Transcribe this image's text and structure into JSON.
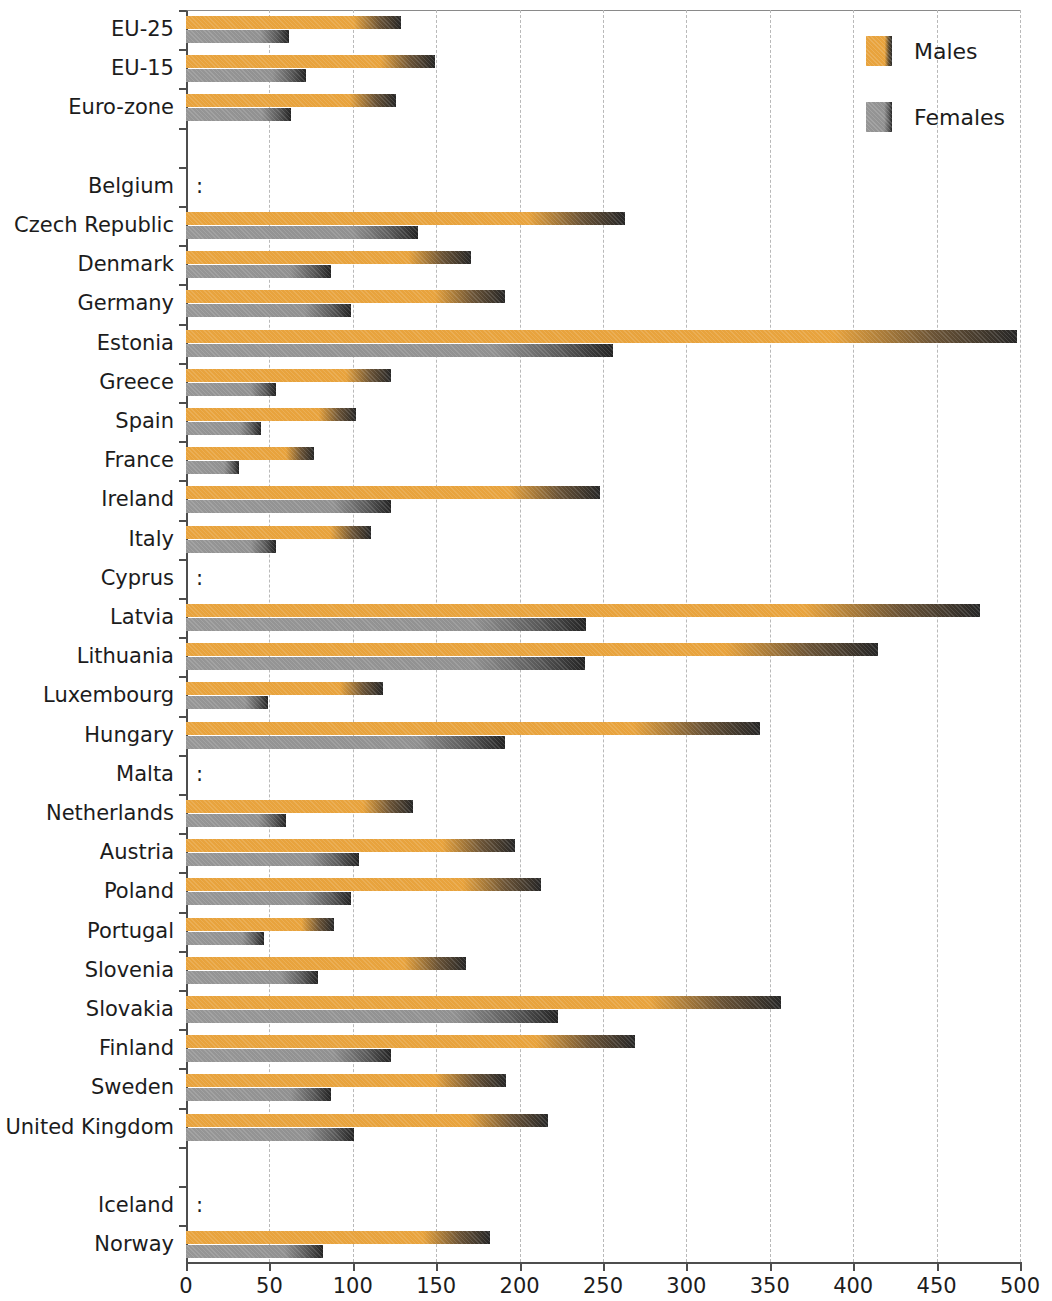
{
  "chart_data": {
    "type": "bar",
    "orientation": "horizontal",
    "title": "",
    "subtitle": "",
    "xlabel": "",
    "ylabel": "",
    "xlim": [
      0,
      500
    ],
    "xticks": [
      0,
      50,
      100,
      150,
      200,
      250,
      300,
      350,
      400,
      450,
      500
    ],
    "grid": true,
    "grid_axis": "x",
    "grid_style": "dotted",
    "legend": {
      "position": "top-right",
      "entries": [
        {
          "name": "Males",
          "color": "#e8a33d"
        },
        {
          "name": "Females",
          "color": "#969696"
        }
      ]
    },
    "missing_marker": ":",
    "categories": [
      "EU-25",
      "EU-15",
      "Euro-zone",
      "",
      "Belgium",
      "Czech Republic",
      "Denmark",
      "Germany",
      "Estonia",
      "Greece",
      "Spain",
      "France",
      "Ireland",
      "Italy",
      "Cyprus",
      "Latvia",
      "Lithuania",
      "Luxembourg",
      "Hungary",
      "Malta",
      "Netherlands",
      "Austria",
      "Poland",
      "Portugal",
      "Slovenia",
      "Slovakia",
      "Finland",
      "Sweden",
      "United Kingdom",
      "",
      "Iceland",
      "Norway"
    ],
    "series": [
      {
        "name": "Males",
        "color": "#e8a33d",
        "values": [
          129,
          149,
          126,
          null,
          null,
          263,
          171,
          191,
          498,
          123,
          102,
          77,
          248,
          111,
          null,
          476,
          415,
          118,
          344,
          null,
          136,
          197,
          213,
          89,
          168,
          357,
          269,
          192,
          217,
          null,
          null,
          182
        ]
      },
      {
        "name": "Females",
        "color": "#969696",
        "values": [
          62,
          72,
          63,
          null,
          null,
          139,
          87,
          99,
          256,
          54,
          45,
          32,
          123,
          54,
          null,
          240,
          239,
          49,
          191,
          null,
          60,
          104,
          99,
          47,
          79,
          223,
          123,
          87,
          101,
          null,
          null,
          82
        ]
      }
    ],
    "rows": [
      {
        "label": "EU-25",
        "male": 129,
        "female": 62,
        "missing": false,
        "gap": false
      },
      {
        "label": "EU-15",
        "male": 149,
        "female": 72,
        "missing": false,
        "gap": false
      },
      {
        "label": "Euro-zone",
        "male": 126,
        "female": 63,
        "missing": false,
        "gap": false
      },
      {
        "label": "",
        "male": null,
        "female": null,
        "missing": false,
        "gap": true
      },
      {
        "label": "Belgium",
        "male": null,
        "female": null,
        "missing": true,
        "gap": false
      },
      {
        "label": "Czech Republic",
        "male": 263,
        "female": 139,
        "missing": false,
        "gap": false
      },
      {
        "label": "Denmark",
        "male": 171,
        "female": 87,
        "missing": false,
        "gap": false
      },
      {
        "label": "Germany",
        "male": 191,
        "female": 99,
        "missing": false,
        "gap": false
      },
      {
        "label": "Estonia",
        "male": 498,
        "female": 256,
        "missing": false,
        "gap": false
      },
      {
        "label": "Greece",
        "male": 123,
        "female": 54,
        "missing": false,
        "gap": false
      },
      {
        "label": "Spain",
        "male": 102,
        "female": 45,
        "missing": false,
        "gap": false
      },
      {
        "label": "France",
        "male": 77,
        "female": 32,
        "missing": false,
        "gap": false
      },
      {
        "label": "Ireland",
        "male": 248,
        "female": 123,
        "missing": false,
        "gap": false
      },
      {
        "label": "Italy",
        "male": 111,
        "female": 54,
        "missing": false,
        "gap": false
      },
      {
        "label": "Cyprus",
        "male": null,
        "female": null,
        "missing": true,
        "gap": false
      },
      {
        "label": "Latvia",
        "male": 476,
        "female": 240,
        "missing": false,
        "gap": false
      },
      {
        "label": "Lithuania",
        "male": 415,
        "female": 239,
        "missing": false,
        "gap": false
      },
      {
        "label": "Luxembourg",
        "male": 118,
        "female": 49,
        "missing": false,
        "gap": false
      },
      {
        "label": "Hungary",
        "male": 344,
        "female": 191,
        "missing": false,
        "gap": false
      },
      {
        "label": "Malta",
        "male": null,
        "female": null,
        "missing": true,
        "gap": false
      },
      {
        "label": "Netherlands",
        "male": 136,
        "female": 60,
        "missing": false,
        "gap": false
      },
      {
        "label": "Austria",
        "male": 197,
        "female": 104,
        "missing": false,
        "gap": false
      },
      {
        "label": "Poland",
        "male": 213,
        "female": 99,
        "missing": false,
        "gap": false
      },
      {
        "label": "Portugal",
        "male": 89,
        "female": 47,
        "missing": false,
        "gap": false
      },
      {
        "label": "Slovenia",
        "male": 168,
        "female": 79,
        "missing": false,
        "gap": false
      },
      {
        "label": "Slovakia",
        "male": 357,
        "female": 223,
        "missing": false,
        "gap": false
      },
      {
        "label": "Finland",
        "male": 269,
        "female": 123,
        "missing": false,
        "gap": false
      },
      {
        "label": "Sweden",
        "male": 192,
        "female": 87,
        "missing": false,
        "gap": false
      },
      {
        "label": "United Kingdom",
        "male": 217,
        "female": 101,
        "missing": false,
        "gap": false
      },
      {
        "label": "",
        "male": null,
        "female": null,
        "missing": false,
        "gap": true
      },
      {
        "label": "Iceland",
        "male": null,
        "female": null,
        "missing": true,
        "gap": false
      },
      {
        "label": "Norway",
        "male": 182,
        "female": 82,
        "missing": false,
        "gap": false
      }
    ]
  }
}
